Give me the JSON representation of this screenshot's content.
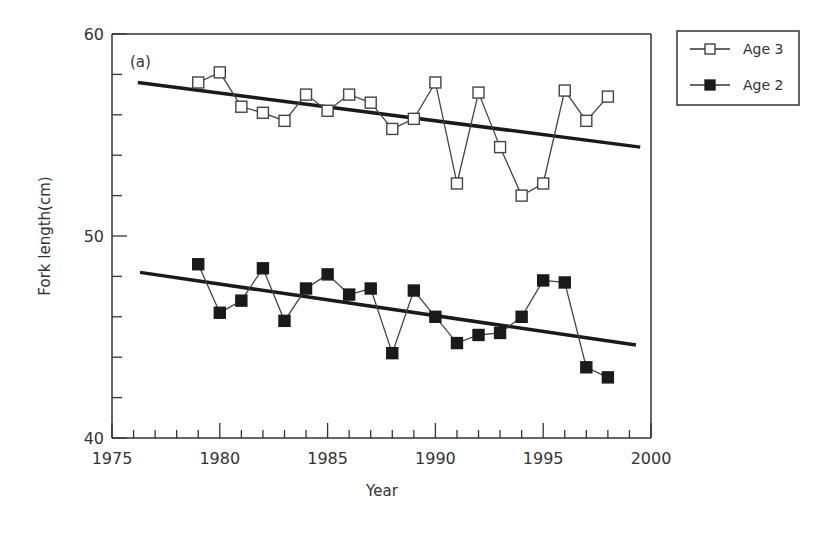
{
  "chart_data": {
    "type": "line",
    "title": "",
    "panel_label": "(a)",
    "xlabel": "Year",
    "ylabel": "Fork length(cm)",
    "xlim": [
      1975,
      2000
    ],
    "ylim": [
      40,
      60
    ],
    "x_ticks": [
      1975,
      1980,
      1985,
      1990,
      1995,
      2000
    ],
    "x_tick_labels": [
      "1975",
      "1980",
      "1985",
      "1990",
      "1995",
      "2000"
    ],
    "x_minor_tick_step": 1,
    "y_ticks": [
      40,
      50,
      60
    ],
    "y_tick_labels": [
      "40",
      "50",
      "60"
    ],
    "y_minor_tick_step": 2,
    "grid": false,
    "legend_position": "upper right, outside plot",
    "x": [
      1979,
      1980,
      1981,
      1982,
      1983,
      1984,
      1985,
      1986,
      1987,
      1988,
      1989,
      1990,
      1991,
      1992,
      1993,
      1994,
      1995,
      1996,
      1997,
      1998
    ],
    "series": [
      {
        "name": "Age 3",
        "marker": "open-square",
        "color": "#333333",
        "values": [
          57.6,
          58.1,
          56.4,
          56.1,
          55.7,
          57.0,
          56.2,
          57.0,
          56.6,
          55.3,
          55.8,
          57.6,
          52.6,
          57.1,
          54.4,
          52.0,
          52.6,
          57.2,
          55.7,
          56.9
        ],
        "trend_line": {
          "x": [
            1976.2,
            1999.5
          ],
          "y": [
            57.6,
            54.4
          ]
        }
      },
      {
        "name": "Age 2",
        "marker": "filled-square",
        "color": "#1a1a1a",
        "values": [
          48.6,
          46.2,
          46.8,
          48.4,
          45.8,
          47.4,
          48.1,
          47.1,
          47.4,
          44.2,
          47.3,
          46.0,
          44.7,
          45.1,
          45.2,
          46.0,
          47.8,
          47.7,
          43.5,
          43.0
        ],
        "trend_line": {
          "x": [
            1976.3,
            1999.3
          ],
          "y": [
            48.2,
            44.6
          ]
        }
      }
    ]
  },
  "legend": {
    "items": [
      {
        "label": "Age 3",
        "marker": "open-square"
      },
      {
        "label": "Age 2",
        "marker": "filled-square"
      }
    ]
  }
}
